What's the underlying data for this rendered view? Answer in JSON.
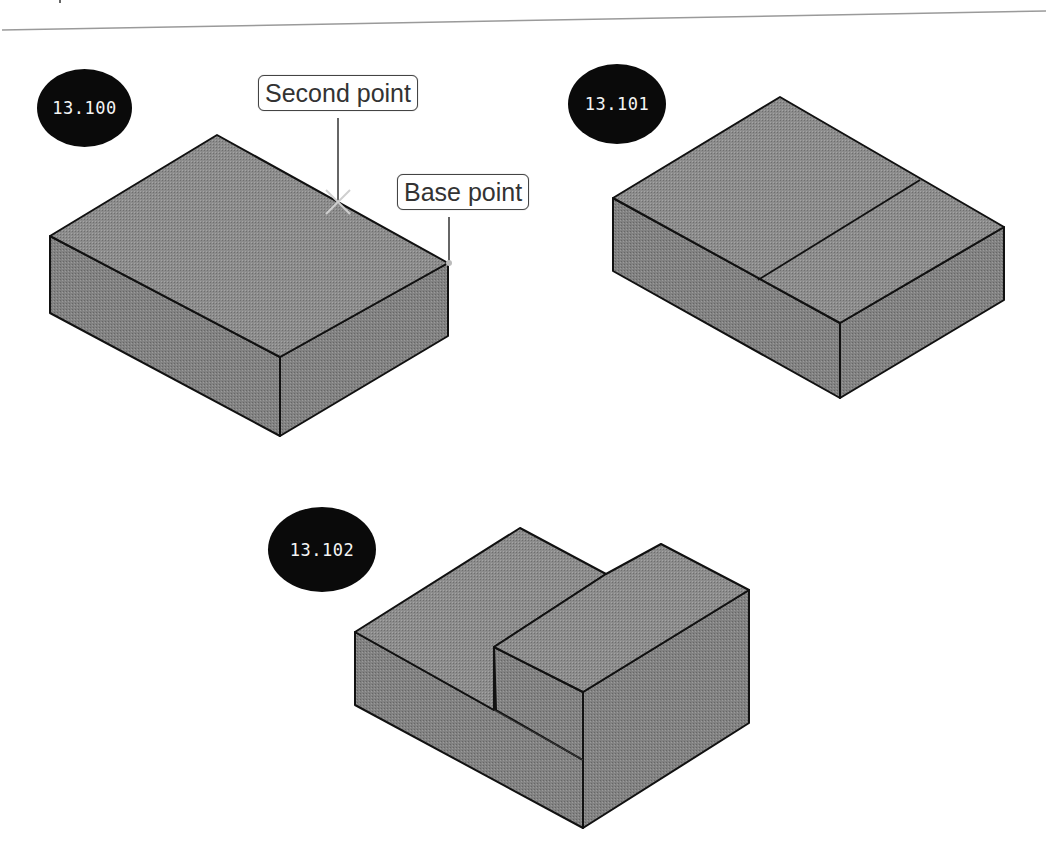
{
  "page": {
    "top_rule": true
  },
  "figures": [
    {
      "id": "fig-13-100",
      "label": "13.100",
      "description": "Rectangular box with Base point and Second point picks",
      "callouts": [
        {
          "name": "second-point",
          "text": "Second point"
        },
        {
          "name": "base-point",
          "text": "Base point"
        }
      ]
    },
    {
      "id": "fig-13-101",
      "label": "13.101",
      "description": "Box with a dividing edge on the top face"
    },
    {
      "id": "fig-13-102",
      "label": "13.102",
      "description": "Stepped solid after pressing/pulling the top region"
    }
  ],
  "colors": {
    "face_fill": "#8a8a8a",
    "face_side": "#7d7d7d",
    "edge": "#111111",
    "badge": "#0a0a0a",
    "badge_text": "#f4f4f4"
  }
}
